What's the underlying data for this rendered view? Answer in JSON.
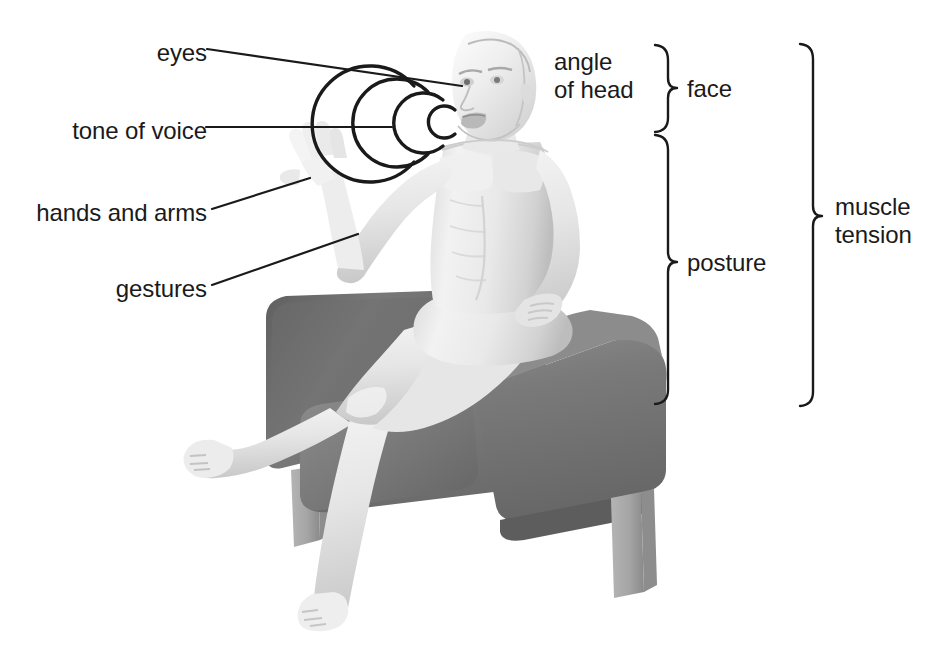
{
  "diagram": {
    "background_color": "#ffffff",
    "text_color": "#1a1a1a",
    "leader_line_color": "#1a1a1a",
    "brace_color": "#1a1a1a"
  },
  "left_labels": [
    {
      "id": "eyes",
      "text": "eyes",
      "anchor": "eye of the figure"
    },
    {
      "id": "tone-of-voice",
      "text": "tone of voice",
      "anchor": "sound waves at the mouth"
    },
    {
      "id": "hands-and-arms",
      "text": "hands and arms",
      "anchor": "raised open hand"
    },
    {
      "id": "gestures",
      "text": "gestures",
      "anchor": "raised forearm"
    }
  ],
  "right_labels": [
    {
      "id": "angle-of-head",
      "line1": "angle",
      "line2": "of head"
    }
  ],
  "braces": [
    {
      "id": "face",
      "label": "face",
      "spans": "head and face region"
    },
    {
      "id": "posture",
      "label": "posture",
      "spans": "torso, arms and legs"
    },
    {
      "id": "muscle-tension",
      "label_line1": "muscle",
      "label_line2": "tension",
      "spans": "whole body"
    }
  ],
  "figure": {
    "skin_light": "#f4f4f4",
    "skin_mid": "#e2e2e2",
    "skin_shadow": "#c6c6c6",
    "sound_wave_count": 4
  },
  "chair": {
    "description": "Dark grey armchair with back panel, two arms and four legs",
    "upholstery": "#767676",
    "upholstery_dark": "#636363",
    "upholstery_light": "#8b8b8b",
    "leg_color": "#a8a8a8",
    "leg_shadow": "#8e8e8e"
  }
}
